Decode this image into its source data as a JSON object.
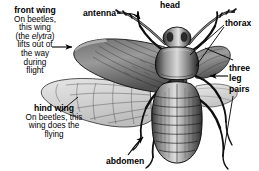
{
  "figure": {
    "subject": "beetle",
    "style": "black-and-white engraving illustration",
    "background_color": "#ffffff",
    "ink_color": "#000000"
  },
  "labels": {
    "front_wing": {
      "term": "front wing",
      "description": "On beetles, this wing (the elytra) lifts out of the way during flight",
      "line1": "On beetles,",
      "line2": "this wing",
      "line3_pre": "(the ",
      "line3_italic": "elytra",
      "line3_post": ")",
      "line4": "lifts out of",
      "line5": "the way",
      "line6": "during",
      "line7": "flight",
      "pointer": "arrow-right"
    },
    "hind_wing": {
      "term": "hind wing",
      "description": "On beetles, this wing does the flying",
      "line1": "On beetles, this",
      "line2": "wing does the",
      "line3": "flying",
      "pointer": "leader-line-up-right"
    },
    "antenna": {
      "term": "antenna",
      "pointer": "arrow-right"
    },
    "head": {
      "term": "head",
      "pointer": "none"
    },
    "thorax": {
      "term": "thorax",
      "pointer": "leader-lines-left"
    },
    "legs": {
      "term": "three leg pairs",
      "line1": "three",
      "line2": "leg",
      "line3": "pairs",
      "pointer": "arrow-left"
    },
    "abdomen": {
      "term": "abdomen",
      "pointer": "arrow-up"
    }
  },
  "icons": {
    "arrow_right": "arrow-right-icon",
    "arrow_left": "arrow-left-icon",
    "arrow_up": "arrow-up-icon",
    "leader_line": "leader-line-icon"
  }
}
